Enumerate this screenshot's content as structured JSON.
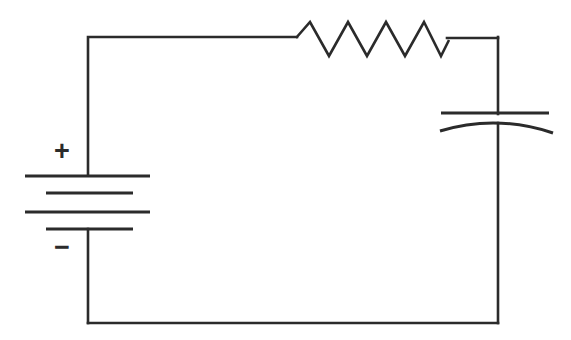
{
  "diagram": {
    "background_color": "#ffffff",
    "stroke_color": "#2b2b2b",
    "width": 571,
    "height": 340,
    "components": [
      {
        "id": "battery",
        "name": "battery",
        "kind": "dc-voltage-source",
        "plus_label": "+",
        "minus_label": "−",
        "plus_position": {
          "x": 62,
          "y": 153
        },
        "minus_position": {
          "x": 62,
          "y": 249
        },
        "terminal_x": 88,
        "plates": [
          {
            "order": 1,
            "type": "long",
            "y": 176,
            "x1": 25,
            "x2": 150
          },
          {
            "order": 2,
            "type": "short",
            "y": 193,
            "x1": 46,
            "x2": 133
          },
          {
            "order": 3,
            "type": "long",
            "y": 212,
            "x1": 25,
            "x2": 150
          },
          {
            "order": 4,
            "type": "short",
            "y": 229,
            "x1": 46,
            "x2": 133
          }
        ]
      },
      {
        "id": "resistor",
        "name": "resistor",
        "kind": "resistor-zigzag",
        "baseline_y": 37,
        "start_x": 296,
        "end_x": 447,
        "peak_y": 22,
        "valley_y": 56,
        "peak_count": 4,
        "path": "M 296 38 L 310 22 L 329 56 L 348 22 L 367 56 L 386 22 L 405 56 L 424 22 L 441 56 L 449 40"
      },
      {
        "id": "capacitor",
        "name": "capacitor",
        "kind": "capacitor-curved-plate",
        "terminal_x": 498,
        "straight_plate": {
          "y": 113,
          "x1": 441,
          "x2": 549
        },
        "curved_plate": {
          "x1": 440,
          "y1": 131,
          "cx": 496,
          "cy": 114,
          "x2": 553,
          "y2": 133
        }
      }
    ],
    "wires": [
      {
        "id": "top-left-wire",
        "name": "wire-battery-top-to-resistor",
        "path": "M 88 175 L 88 37 L 297 37"
      },
      {
        "id": "top-right-wire",
        "name": "wire-resistor-to-corner",
        "path": "M 447 38 L 498 38"
      },
      {
        "id": "right-upper-wire",
        "name": "wire-corner-to-capacitor",
        "path": "M 498 37 L 498 114"
      },
      {
        "id": "right-lower-wire",
        "name": "wire-capacitor-to-bottom",
        "path": "M 498 123 L 498 323"
      },
      {
        "id": "bottom-wire",
        "name": "wire-bottom-return",
        "path": "M 498 323 L 88 323"
      },
      {
        "id": "left-lower-wire",
        "name": "wire-battery-bottom",
        "path": "M 88 323 L 88 229"
      }
    ]
  }
}
